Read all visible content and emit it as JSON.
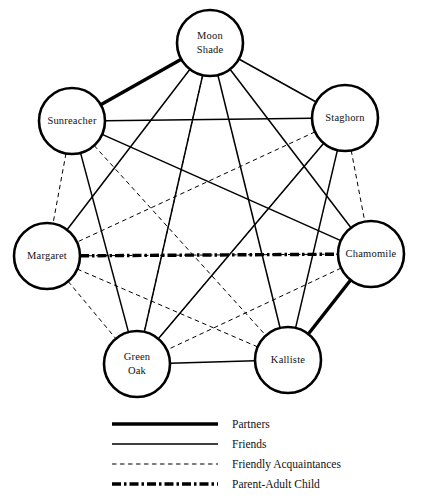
{
  "diagram": {
    "background_color": "#ffffff",
    "line_color": "#000000",
    "node_radius": 33,
    "nodes": [
      {
        "id": "moon_shade",
        "label": "Moon Shade",
        "line1": "Moon",
        "line2": "Shade",
        "x": 210,
        "y": 43
      },
      {
        "id": "sunreacher",
        "label": "Sunreacher",
        "line1": "Sunreacher",
        "line2": "",
        "x": 72,
        "y": 121
      },
      {
        "id": "staghorn",
        "label": "Staghorn",
        "line1": "Staghorn",
        "line2": "",
        "x": 345,
        "y": 118
      },
      {
        "id": "margaret",
        "label": "Margaret",
        "line1": "Margaret",
        "line2": "",
        "x": 47,
        "y": 256
      },
      {
        "id": "chamomile",
        "label": "Chamomile",
        "line1": "Chamomile",
        "line2": "",
        "x": 371,
        "y": 254
      },
      {
        "id": "green_oak",
        "label": "Green Oak",
        "line1": "Green",
        "line2": "Oak",
        "x": 137,
        "y": 364
      },
      {
        "id": "kalliste",
        "label": "Kalliste",
        "line1": "Kalliste",
        "line2": "",
        "x": 288,
        "y": 360
      }
    ],
    "edges": [
      {
        "source": "moon_shade",
        "target": "sunreacher",
        "type": "partners"
      },
      {
        "source": "chamomile",
        "target": "kalliste",
        "type": "partners"
      },
      {
        "source": "moon_shade",
        "target": "staghorn",
        "type": "friends"
      },
      {
        "source": "moon_shade",
        "target": "margaret",
        "type": "friends"
      },
      {
        "source": "moon_shade",
        "target": "green_oak",
        "type": "friends"
      },
      {
        "source": "moon_shade",
        "target": "kalliste",
        "type": "friends"
      },
      {
        "source": "moon_shade",
        "target": "chamomile",
        "type": "friends"
      },
      {
        "source": "sunreacher",
        "target": "staghorn",
        "type": "friends"
      },
      {
        "source": "sunreacher",
        "target": "green_oak",
        "type": "friends"
      },
      {
        "source": "sunreacher",
        "target": "chamomile",
        "type": "friends"
      },
      {
        "source": "staghorn",
        "target": "green_oak",
        "type": "friends"
      },
      {
        "source": "staghorn",
        "target": "kalliste",
        "type": "friends"
      },
      {
        "source": "green_oak",
        "target": "kalliste",
        "type": "friends"
      },
      {
        "source": "moon_shade",
        "target": "green_oak",
        "type": "acquaintances"
      },
      {
        "source": "sunreacher",
        "target": "margaret",
        "type": "acquaintances"
      },
      {
        "source": "sunreacher",
        "target": "kalliste",
        "type": "acquaintances"
      },
      {
        "source": "staghorn",
        "target": "margaret",
        "type": "acquaintances"
      },
      {
        "source": "staghorn",
        "target": "green_oak",
        "type": "acquaintances"
      },
      {
        "source": "staghorn",
        "target": "chamomile",
        "type": "acquaintances"
      },
      {
        "source": "margaret",
        "target": "green_oak",
        "type": "acquaintances"
      },
      {
        "source": "margaret",
        "target": "kalliste",
        "type": "acquaintances"
      },
      {
        "source": "margaret",
        "target": "chamomile",
        "type": "acquaintances"
      },
      {
        "source": "chamomile",
        "target": "green_oak",
        "type": "acquaintances"
      },
      {
        "source": "margaret",
        "target": "chamomile",
        "type": "parent_adult_child"
      }
    ]
  },
  "legend": {
    "x_line_start": 112,
    "x_line_end": 218,
    "x_text": 232,
    "items": [
      {
        "id": "partners",
        "label": "Partners",
        "type": "partners",
        "y": 424
      },
      {
        "id": "friends",
        "label": "Friends",
        "type": "friends",
        "y": 444
      },
      {
        "id": "acquaintances",
        "label": "Friendly Acquaintances",
        "type": "acquaintances",
        "y": 464
      },
      {
        "id": "parent_adult_child",
        "label": "Parent-Adult Child",
        "type": "parent_adult_child",
        "y": 484
      }
    ]
  }
}
